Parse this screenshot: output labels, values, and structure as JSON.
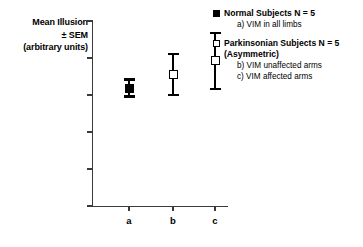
{
  "chart_data": {
    "type": "scatter",
    "title": "",
    "xlabel": "",
    "ylabel_lines": [
      "Mean Illusion",
      "± SEM",
      "(arbitrary units)"
    ],
    "ylim": [
      0,
      25
    ],
    "yticks": [
      0,
      5,
      10,
      15,
      20,
      25
    ],
    "ytick_labels": [
      "0",
      "5",
      "10",
      "15",
      "20",
      "25"
    ],
    "categories": [
      "a",
      "b",
      "c"
    ],
    "grid": false,
    "legend_position": "right",
    "points": [
      {
        "category": "a",
        "value": 15.9,
        "err_low": 14.8,
        "err_high": 17.1,
        "marker": "filled-square",
        "group": "Normal Subjects",
        "condition": "VIM in all limbs"
      },
      {
        "category": "b",
        "value": 17.8,
        "err_low": 15.0,
        "err_high": 20.5,
        "marker": "open-square",
        "group": "Parkinsonian Subjects",
        "condition": "VIM unaffected arms"
      },
      {
        "category": "c",
        "value": 19.6,
        "err_low": 15.8,
        "err_high": 23.4,
        "marker": "open-square",
        "group": "Parkinsonian Subjects",
        "condition": "VIM affected arms"
      }
    ]
  },
  "legend": {
    "groups": [
      {
        "swatch": "filled-square",
        "title": "Normal Subjects N = 5",
        "subtitle": "",
        "items": [
          "a) VIM in all limbs"
        ]
      },
      {
        "swatch": "open-square",
        "title": "Parkinsonian Subjects N = 5",
        "subtitle": "(Asymmetric)",
        "items": [
          "b) VIM unaffected arms",
          "c) VIM affected arms"
        ]
      }
    ]
  },
  "colors": {
    "marker": "#000000",
    "axis": "#3a3a3a",
    "background": "#ffffff"
  }
}
